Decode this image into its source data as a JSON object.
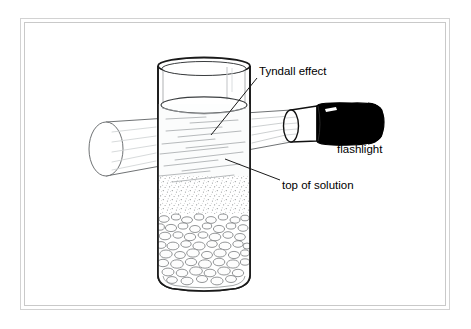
{
  "figure": {
    "kind": "science-diagram",
    "background_color": "#ffffff",
    "frame": {
      "style": "double-line",
      "outer_color": "#d2d2d2",
      "inner_color": "#c9c9c9"
    }
  },
  "labels": {
    "tyndall": "Tyndall effect",
    "flashlight": "flashlight",
    "top_of_solution": "top of solution"
  },
  "objects": {
    "glass": {
      "name": "glass cylinder",
      "outline_color": "#1a1a1a",
      "fill_color": "#ffffff"
    },
    "solution": {
      "name": "colloidal solution",
      "surface_label": "top of solution",
      "tint": "#f7f8f8"
    },
    "sediment": {
      "name": "settled particles",
      "upper_texture": "fine stipple",
      "lower_texture": "pebbles",
      "color": "#7d7d7d"
    },
    "light_beam": {
      "name": "light cone",
      "outline_color": "#5a5a5a",
      "streak_color": "#b9bcbd"
    },
    "flashlight_body": {
      "bezel_color": "#ffffff",
      "barrel_color": "#000000",
      "switch_color": "#ffffff"
    }
  },
  "leader_lines": {
    "tyndall_leader": "from label down-left into beam inside liquid",
    "top_of_solution_leader": "from label up-left to liquid surface"
  }
}
